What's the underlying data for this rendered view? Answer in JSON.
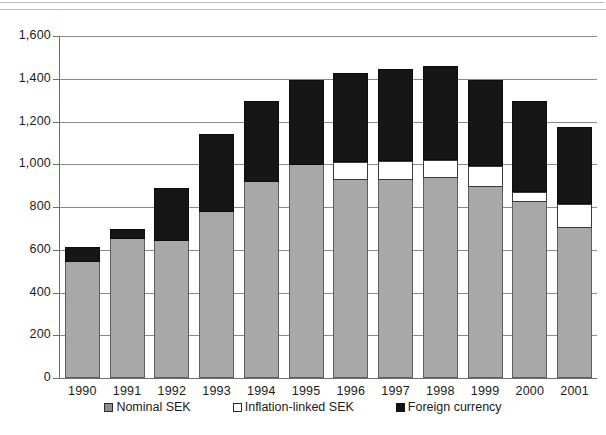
{
  "chart_data": {
    "type": "bar",
    "stacked": true,
    "title": "",
    "subtitle": "",
    "xlabel": "",
    "ylabel": "",
    "ylim": [
      0,
      1600
    ],
    "ytick_step": 200,
    "ytick_labels": [
      "1,600",
      "1,400",
      "1,200",
      "1,000",
      "800",
      "600",
      "400",
      "200",
      "0"
    ],
    "ytick_values": [
      1600,
      1400,
      1200,
      1000,
      800,
      600,
      400,
      200,
      0
    ],
    "grid": true,
    "legend_position": "bottom",
    "categories": [
      "1990",
      "1991",
      "1992",
      "1993",
      "1994",
      "1995",
      "1996",
      "1997",
      "1998",
      "1999",
      "2000",
      "2001"
    ],
    "series": [
      {
        "name": "Nominal SEK",
        "color": "#a8a8a8",
        "values": [
          545,
          650,
          640,
          775,
          915,
          995,
          925,
          925,
          935,
          895,
          825,
          700
        ]
      },
      {
        "name": "Inflation-linked SEK",
        "color": "#ffffff",
        "values": [
          0,
          0,
          0,
          0,
          0,
          0,
          85,
          90,
          85,
          95,
          45,
          115
        ]
      },
      {
        "name": "Foreign currency",
        "color": "#161616",
        "values": [
          70,
          45,
          250,
          365,
          380,
          400,
          415,
          430,
          440,
          405,
          425,
          360
        ]
      }
    ],
    "totals": [
      615,
      695,
      890,
      1140,
      1295,
      1395,
      1425,
      1445,
      1460,
      1395,
      1295,
      1175
    ]
  },
  "legend": {
    "items": [
      {
        "label": "Nominal SEK",
        "swatch": "nominal"
      },
      {
        "label": "Inflation-linked SEK",
        "swatch": "linked"
      },
      {
        "label": "Foreign currency",
        "swatch": "foreign"
      }
    ]
  }
}
